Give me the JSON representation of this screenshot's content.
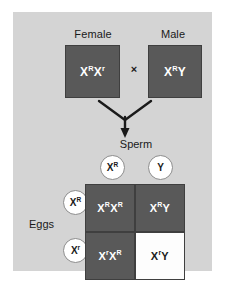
{
  "diagram": {
    "background_color": "#ffffff",
    "panel_color": "#d4d4d4",
    "dark_cell_color": "#595959",
    "light_cell_color": "#fdfdfd",
    "border_color": "#3f3f3f",
    "text_color": "#1a1a1a"
  },
  "parents": {
    "female": {
      "label": "Female",
      "genotype_allele_1": "X",
      "genotype_sup_1": "R",
      "genotype_allele_2": "X",
      "genotype_sup_2": "r"
    },
    "male": {
      "label": "Male",
      "genotype_allele_1": "X",
      "genotype_sup_1": "R",
      "genotype_allele_2": "Y",
      "genotype_sup_2": ""
    },
    "cross_symbol": "×"
  },
  "gametes": {
    "sperm_label": "Sperm",
    "eggs_label": "Eggs",
    "sperm": [
      {
        "allele": "X",
        "sup": "R"
      },
      {
        "allele": "Y",
        "sup": ""
      }
    ],
    "eggs": [
      {
        "allele": "X",
        "sup": "R"
      },
      {
        "allele": "X",
        "sup": "r"
      }
    ]
  },
  "punnett": {
    "cells": [
      {
        "row": 0,
        "col": 0,
        "fill": "dark",
        "a1": "X",
        "s1": "R",
        "a2": "X",
        "s2": "R",
        "name": "offspring-XR-XR"
      },
      {
        "row": 0,
        "col": 1,
        "fill": "dark",
        "a1": "X",
        "s1": "R",
        "a2": "Y",
        "s2": "",
        "name": "offspring-XR-Y"
      },
      {
        "row": 1,
        "col": 0,
        "fill": "dark",
        "a1": "X",
        "s1": "r",
        "a2": "X",
        "s2": "R",
        "name": "offspring-Xr-XR"
      },
      {
        "row": 1,
        "col": 1,
        "fill": "light",
        "a1": "X",
        "s1": "r",
        "a2": "Y",
        "s2": "",
        "name": "offspring-Xr-Y"
      }
    ]
  },
  "icons": {
    "arrow": "converging-down-arrow-icon"
  }
}
